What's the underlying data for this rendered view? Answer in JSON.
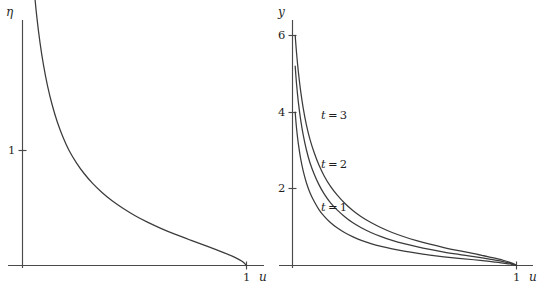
{
  "figure": {
    "title": "",
    "background_color": "#ffffff",
    "curve_color": "#3b3b3b",
    "axis_color": "#4a4a4a",
    "panels": [
      "left",
      "right"
    ]
  },
  "chart_data": [
    {
      "type": "line",
      "panel": "left",
      "title": "",
      "xlabel": "u",
      "ylabel": "η",
      "xlim": [
        0,
        1.08
      ],
      "ylim": [
        0,
        4.3
      ],
      "grid": false,
      "legend": null,
      "xticks": [
        {
          "value": 1,
          "label": "1"
        }
      ],
      "yticks": [
        {
          "value": 1,
          "label": "1"
        }
      ],
      "series": [
        {
          "name": "eta(u)",
          "label": "",
          "x": [
            0.012,
            0.018,
            0.025,
            0.033,
            0.042,
            0.052,
            0.064,
            0.078,
            0.094,
            0.112,
            0.132,
            0.155,
            0.18,
            0.208,
            0.24,
            0.275,
            0.313,
            0.355,
            0.4,
            0.45,
            0.503,
            0.56,
            0.62,
            0.683,
            0.75,
            0.82,
            0.892,
            0.948,
            0.98,
            1.0
          ],
          "y": [
            4.22,
            3.72,
            3.3,
            2.96,
            2.66,
            2.4,
            2.16,
            1.94,
            1.74,
            1.56,
            1.4,
            1.25,
            1.12,
            1.0,
            0.895,
            0.8,
            0.714,
            0.635,
            0.563,
            0.496,
            0.433,
            0.375,
            0.321,
            0.27,
            0.22,
            0.17,
            0.116,
            0.071,
            0.036,
            0.0
          ]
        }
      ]
    },
    {
      "type": "line",
      "panel": "right",
      "title": "",
      "xlabel": "u",
      "ylabel": "y",
      "xlim": [
        0,
        1.08
      ],
      "ylim": [
        0,
        6.4
      ],
      "grid": false,
      "legend": "inline-annotations",
      "xticks": [
        {
          "value": 1,
          "label": "1"
        }
      ],
      "yticks": [
        {
          "value": 2,
          "label": "2"
        },
        {
          "value": 4,
          "label": "4"
        },
        {
          "value": 6,
          "label": "6"
        }
      ],
      "annotations": [
        {
          "text": "t = 3",
          "x": 0.215,
          "y": 3.8
        },
        {
          "text": "t = 2",
          "x": 0.215,
          "y": 2.53
        },
        {
          "text": "t = 1",
          "x": 0.215,
          "y": 1.42
        }
      ],
      "series": [
        {
          "name": "t = 3",
          "label": "t = 3",
          "t": 3,
          "x": [
            0.012,
            0.018,
            0.026,
            0.036,
            0.048,
            0.062,
            0.078,
            0.097,
            0.118,
            0.142,
            0.169,
            0.199,
            0.232,
            0.268,
            0.307,
            0.35,
            0.396,
            0.445,
            0.498,
            0.554,
            0.613,
            0.676,
            0.742,
            0.81,
            0.88,
            0.94,
            0.98,
            1.0
          ],
          "y": [
            6.0,
            5.55,
            5.06,
            4.57,
            4.1,
            3.67,
            3.29,
            2.94,
            2.62,
            2.33,
            2.07,
            1.84,
            1.63,
            1.44,
            1.27,
            1.12,
            0.985,
            0.862,
            0.75,
            0.648,
            0.555,
            0.469,
            0.389,
            0.312,
            0.221,
            0.137,
            0.06,
            0.0
          ]
        },
        {
          "name": "t = 2",
          "label": "t = 2",
          "t": 2,
          "x": [
            0.012,
            0.018,
            0.026,
            0.036,
            0.048,
            0.062,
            0.078,
            0.097,
            0.118,
            0.142,
            0.169,
            0.199,
            0.232,
            0.268,
            0.307,
            0.35,
            0.396,
            0.445,
            0.498,
            0.554,
            0.613,
            0.676,
            0.742,
            0.81,
            0.88,
            0.94,
            0.98,
            1.0
          ],
          "y": [
            5.2,
            4.74,
            4.27,
            3.82,
            3.4,
            3.02,
            2.68,
            2.38,
            2.11,
            1.86,
            1.64,
            1.45,
            1.28,
            1.12,
            0.985,
            0.862,
            0.755,
            0.658,
            0.57,
            0.49,
            0.418,
            0.352,
            0.291,
            0.233,
            0.165,
            0.102,
            0.044,
            0.0
          ]
        },
        {
          "name": "t = 1",
          "label": "t = 1",
          "t": 1,
          "x": [
            0.012,
            0.018,
            0.026,
            0.036,
            0.048,
            0.062,
            0.078,
            0.097,
            0.118,
            0.142,
            0.169,
            0.199,
            0.232,
            0.268,
            0.307,
            0.35,
            0.396,
            0.445,
            0.498,
            0.554,
            0.613,
            0.676,
            0.742,
            0.81,
            0.88,
            0.94,
            0.98,
            1.0
          ],
          "y": [
            4.0,
            3.58,
            3.18,
            2.8,
            2.46,
            2.16,
            1.9,
            1.67,
            1.46,
            1.28,
            1.12,
            0.982,
            0.86,
            0.752,
            0.656,
            0.572,
            0.498,
            0.432,
            0.374,
            0.32,
            0.272,
            0.228,
            0.188,
            0.15,
            0.106,
            0.065,
            0.028,
            0.0
          ]
        }
      ]
    }
  ],
  "left_panel": {
    "name": "left-plot",
    "y_axis_label": "η",
    "x_axis_label": "u",
    "y_tick_label_1": "1",
    "x_tick_label_1": "1"
  },
  "right_panel": {
    "name": "right-plot",
    "y_axis_label": "y",
    "x_axis_label": "u",
    "y_tick_label_6": "6",
    "y_tick_label_4": "4",
    "y_tick_label_2": "2",
    "x_tick_label_1": "1",
    "curve_label_t3_var": "t",
    "curve_label_t3_eq": " = 3",
    "curve_label_t2_var": "t",
    "curve_label_t2_eq": " = 2",
    "curve_label_t1_var": "t",
    "curve_label_t1_eq": " = 1"
  }
}
